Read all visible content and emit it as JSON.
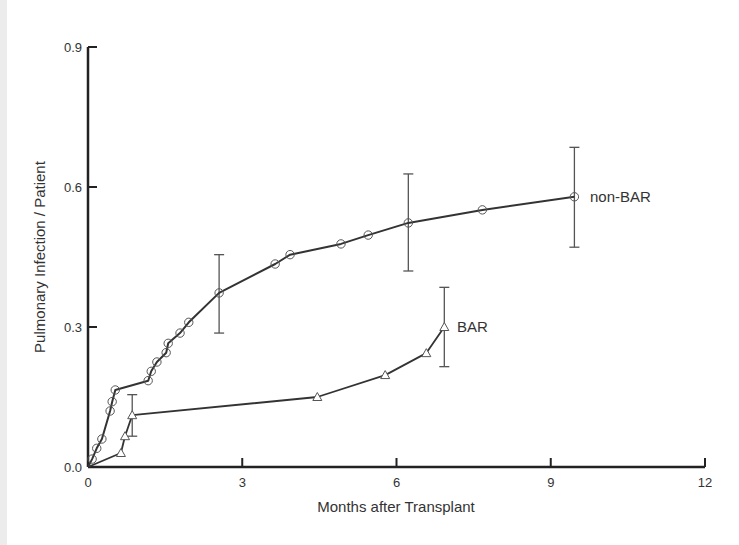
{
  "chart_data": {
    "type": "line",
    "title": "",
    "xlabel": "Months after Transplant",
    "ylabel": "Pulmonary Infection / Patient",
    "xlim": [
      0,
      12
    ],
    "ylim": [
      0,
      0.9
    ],
    "xticks": [
      "0",
      "3",
      "6",
      "9",
      "12"
    ],
    "yticks": [
      "0.0",
      "0.3",
      "0.6",
      "0.9"
    ],
    "grid": false,
    "legend": "inline labels at series ends",
    "series": [
      {
        "name": "non-BAR",
        "marker": "circle",
        "x": [
          0,
          0.08,
          0.17,
          0.27,
          0.43,
          0.47,
          0.53,
          1.17,
          1.23,
          1.34,
          1.52,
          1.56,
          1.79,
          1.96,
          2.55,
          3.64,
          3.93,
          4.92,
          5.45,
          6.23,
          7.67,
          9.46
        ],
        "y": [
          0,
          0.017,
          0.04,
          0.06,
          0.12,
          0.14,
          0.165,
          0.185,
          0.205,
          0.225,
          0.245,
          0.265,
          0.287,
          0.31,
          0.373,
          0.435,
          0.455,
          0.478,
          0.497,
          0.523,
          0.551,
          0.579
        ],
        "error_bars": [
          {
            "x": 2.55,
            "low": 0.287,
            "high": 0.455
          },
          {
            "x": 6.23,
            "low": 0.42,
            "high": 0.628
          },
          {
            "x": 9.46,
            "low": 0.471,
            "high": 0.685
          }
        ]
      },
      {
        "name": "BAR",
        "marker": "triangle",
        "x": [
          0,
          0.64,
          0.72,
          0.86,
          4.46,
          5.78,
          6.58,
          6.93
        ],
        "y": [
          0,
          0.03,
          0.066,
          0.111,
          0.15,
          0.197,
          0.244,
          0.3
        ],
        "error_bars": [
          {
            "x": 0.86,
            "low": 0.066,
            "high": 0.155
          },
          {
            "x": 6.93,
            "low": 0.215,
            "high": 0.385
          }
        ]
      }
    ]
  },
  "colors": {
    "axis": "#222222",
    "line": "#333333",
    "marker": "#555555",
    "errorbar": "#555555",
    "text": "#333333",
    "left_strip": "#ececec"
  }
}
